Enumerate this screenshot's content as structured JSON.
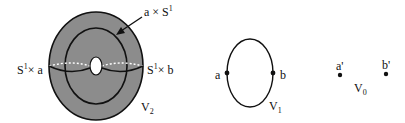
{
  "figure": {
    "panels": [
      {
        "id": "V2",
        "name": "solid torus",
        "label_main": "V",
        "label_sub": "2",
        "fill_color": "#8c8c8c",
        "annotations": [
          {
            "id": "meridian-left",
            "base": "S",
            "sup": "1",
            "rest": "× a"
          },
          {
            "id": "meridian-right",
            "base": "S",
            "sup": "1",
            "rest": "× b"
          },
          {
            "id": "longitude",
            "base": "a × S",
            "sup": "1",
            "rest": ""
          }
        ]
      },
      {
        "id": "V1",
        "name": "circle",
        "label_main": "V",
        "label_sub": "1",
        "points": [
          {
            "label": "a"
          },
          {
            "label": "b"
          }
        ]
      },
      {
        "id": "V0",
        "name": "two points",
        "label_main": "V",
        "label_sub": "0",
        "points": [
          {
            "label": "a'"
          },
          {
            "label": "b'"
          }
        ]
      }
    ]
  }
}
